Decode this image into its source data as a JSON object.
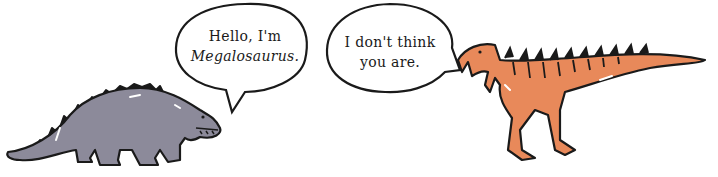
{
  "scene": {
    "left_character": {
      "name": "Megalosaurus",
      "color": "#8c8a9a",
      "speech_line1": "Hello, I'm",
      "speech_line2": "Megalosaurus."
    },
    "right_character": {
      "name": "orange-theropod",
      "color": "#e8895a",
      "speech_line1": "I don't think",
      "speech_line2": "you are."
    },
    "outline_color": "#1a1a1a",
    "background": "#ffffff"
  }
}
